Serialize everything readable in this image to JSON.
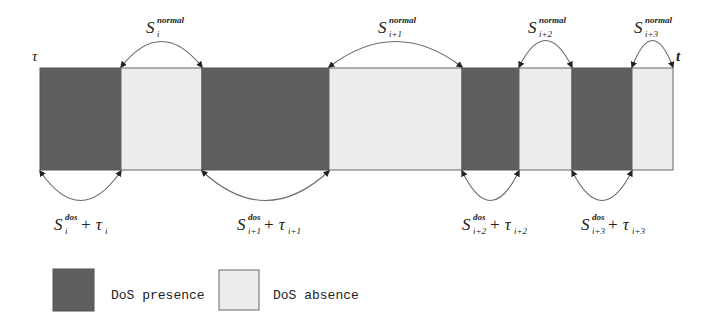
{
  "diagram": {
    "axis_start_label": "τ",
    "axis_end_label": "t",
    "colors": {
      "dos_presence": "#5f5f5f",
      "dos_absence": "#ececec",
      "arc": "#6a6a6a"
    },
    "segments": [
      {
        "type": "dos_presence",
        "x0": 40,
        "x1": 121
      },
      {
        "type": "dos_absence",
        "x0": 121,
        "x1": 202
      },
      {
        "type": "dos_presence",
        "x0": 202,
        "x1": 329
      },
      {
        "type": "dos_absence",
        "x0": 329,
        "x1": 462
      },
      {
        "type": "dos_presence",
        "x0": 462,
        "x1": 519
      },
      {
        "type": "dos_absence",
        "x0": 519,
        "x1": 572
      },
      {
        "type": "dos_presence",
        "x0": 572,
        "x1": 632
      },
      {
        "type": "dos_absence",
        "x0": 632,
        "x1": 673
      }
    ],
    "top_labels": [
      {
        "main": "S",
        "sub": "i",
        "sup": "normal"
      },
      {
        "main": "S",
        "sub": "i+1",
        "sup": "normal"
      },
      {
        "main": "S",
        "sub": "i+2",
        "sup": "normal"
      },
      {
        "main": "S",
        "sub": "i+3",
        "sup": "normal"
      }
    ],
    "bottom_labels": [
      {
        "main": "S",
        "sub": "i",
        "sup": "dos",
        "plus": "+ τ",
        "tau_sub": "i"
      },
      {
        "main": "S",
        "sub": "i+1",
        "sup": "dos",
        "plus": "+ τ",
        "tau_sub": "i+1"
      },
      {
        "main": "S",
        "sub": "i+2",
        "sup": "dos",
        "plus": "+ τ",
        "tau_sub": "i+2"
      },
      {
        "main": "S",
        "sub": "i+3",
        "sup": "dos",
        "plus": "+ τ",
        "tau_sub": "i+3"
      }
    ]
  },
  "legend": {
    "items": [
      {
        "label": "DoS presence",
        "type": "dos_presence"
      },
      {
        "label": "DoS absence",
        "type": "dos_absence"
      }
    ]
  }
}
